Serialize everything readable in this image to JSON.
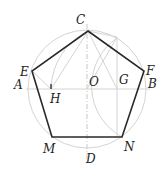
{
  "diagram": {
    "labels": {
      "C": "C",
      "E": "E",
      "F": "F",
      "A": "A",
      "B": "B",
      "O": "O",
      "G": "G",
      "H": "H",
      "M": "M",
      "N": "N",
      "D": "D"
    },
    "points": {
      "O": [
        87,
        89
      ],
      "C": [
        88,
        31
      ],
      "E": [
        32,
        71
      ],
      "F": [
        144,
        71
      ],
      "M": [
        52,
        137
      ],
      "N": [
        122,
        137
      ],
      "H": [
        51,
        89
      ],
      "G": [
        117,
        89
      ]
    },
    "colors": {
      "pentagon": "#2a2a2a",
      "construction": "#d4d4d4",
      "label": "#222222"
    }
  }
}
